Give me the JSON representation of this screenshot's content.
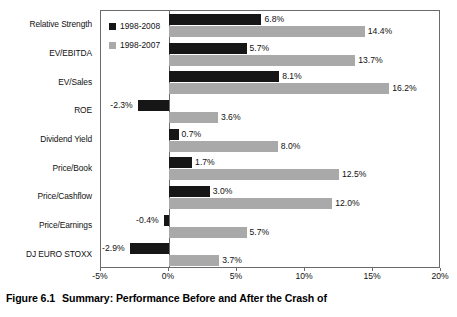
{
  "caption": {
    "number": "Figure 6.1",
    "text": "Summary: Performance Before and After the Crash of"
  },
  "chart_data": {
    "type": "bar",
    "orientation": "horizontal",
    "title": "",
    "xlabel": "",
    "ylabel": "",
    "xlim": [
      -5,
      20
    ],
    "xticks": [
      -5,
      0,
      5,
      10,
      15,
      20
    ],
    "xtick_labels": [
      "-5%",
      "0%",
      "5%",
      "10%",
      "15%",
      "20%"
    ],
    "grid": false,
    "legend_position": "upper-left-inside",
    "colors": {
      "series_0": "#161616",
      "series_1": "#a9a9a9",
      "axis": "#6b6b6b",
      "text": "#111111",
      "background": "#ffffff"
    },
    "categories": [
      "Relative Strength",
      "EV/EBITDA",
      "EV/Sales",
      "ROE",
      "Dividend Yield",
      "Price/Book",
      "Price/Cashflow",
      "Price/Earnings",
      "DJ EURO STOXX"
    ],
    "series": [
      {
        "name": "1998-2008",
        "color": "#161616",
        "values": [
          6.8,
          5.7,
          8.1,
          -2.3,
          0.7,
          1.7,
          3.0,
          -0.4,
          -2.9
        ],
        "labels": [
          "6.8%",
          "5.7%",
          "8.1%",
          "-2.3%",
          "0.7%",
          "1.7%",
          "3.0%",
          "-0.4%",
          "-2.9%"
        ]
      },
      {
        "name": "1998-2007",
        "color": "#a9a9a9",
        "values": [
          14.4,
          13.7,
          16.2,
          3.6,
          8.0,
          12.5,
          12.0,
          5.7,
          3.7
        ],
        "labels": [
          "14.4%",
          "13.7%",
          "16.2%",
          "3.6%",
          "8.0%",
          "12.5%",
          "12.0%",
          "5.7%",
          "3.7%"
        ]
      }
    ]
  },
  "legend": {
    "items": [
      {
        "label": "1998-2008",
        "color": "#161616"
      },
      {
        "label": "1998-2007",
        "color": "#a9a9a9"
      }
    ]
  }
}
